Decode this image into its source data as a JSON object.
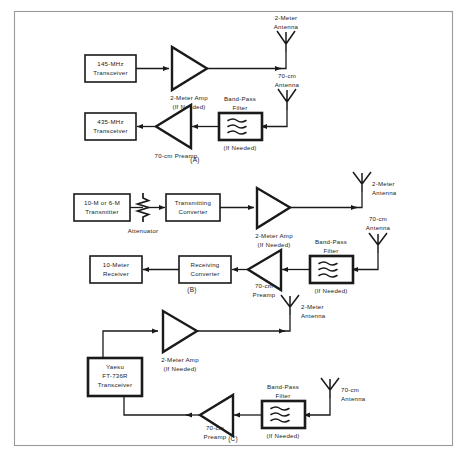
{
  "figure": {
    "border_color": "#9a9a9a",
    "line_color": "#1a1a1a",
    "background": "#ffffff",
    "section_labels": {
      "a": "(A)",
      "b": "(B)",
      "c": "(C)"
    }
  },
  "diagram_a": {
    "transceiver_2m": {
      "line1": "145-MHz",
      "line2": "Transceiver"
    },
    "transceiver_70cm": {
      "line1": "435-MHz",
      "line2": "Transceiver"
    },
    "amp": {
      "line1": "2-Meter Amp",
      "line2": "(If Needed)"
    },
    "preamp": {
      "line1": "70-cm Preamp"
    },
    "filter": {
      "line1": "Band-Pass",
      "line2": "Filter",
      "line3": "(If Needed)"
    },
    "antenna_2m": {
      "line1": "2-Meter",
      "line2": "Antenna"
    },
    "antenna_70cm": {
      "line1": "70-cm",
      "line2": "Antenna"
    }
  },
  "diagram_b": {
    "transmitter": {
      "line1": "10-M or 6-M",
      "line2": "Transmitter"
    },
    "attenuator": {
      "line1": "Attenuator"
    },
    "transmitting_converter": {
      "line1": "Transmitting",
      "line2": "Converter"
    },
    "receiver": {
      "line1": "10-Meter",
      "line2": "Receiver"
    },
    "receiving_converter": {
      "line1": "Receiving",
      "line2": "Converter"
    },
    "amp": {
      "line1": "2-Meter Amp",
      "line2": "(If Needed)"
    },
    "preamp": {
      "line1": "70-cm",
      "line2": "Preamp"
    },
    "filter": {
      "line1": "Band-Pass",
      "line2": "Filter",
      "line3": "(If Needed)"
    },
    "antenna_2m": {
      "line1": "2-Meter",
      "line2": "Antenna"
    },
    "antenna_70cm": {
      "line1": "70-cm",
      "line2": "Antenna"
    }
  },
  "diagram_c": {
    "transceiver": {
      "line1": "Yaesu",
      "line2": "FT-736R",
      "line3": "Transceiver"
    },
    "amp": {
      "line1": "2-Meter Amp",
      "line2": "(If Needed)"
    },
    "preamp": {
      "line1": "70-cm",
      "line2": "Preamp"
    },
    "filter": {
      "line1": "Band-Pass",
      "line2": "Filter",
      "line3": "(If Needed)"
    },
    "antenna_2m": {
      "line1": "2-Meter",
      "line2": "Antenna"
    },
    "antenna_70cm": {
      "line1": "70-cm",
      "line2": "Antenna"
    }
  }
}
